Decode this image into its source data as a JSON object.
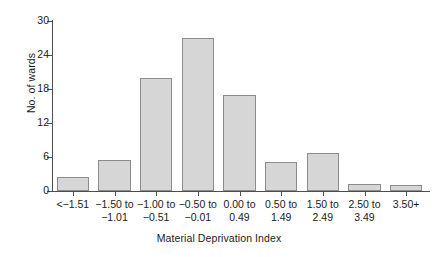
{
  "chart_data": {
    "type": "bar",
    "title": "",
    "xlabel": "Material Deprivation Index",
    "ylabel": "No. of wards",
    "categories": [
      "<−1.51",
      "−1.50 to\n−1.01",
      "−1.00 to\n−0.51",
      "−0.50 to\n−0.01",
      "0.00 to\n0.49",
      "0.50 to\n1.49",
      "1.50 to\n2.49",
      "2.50 to\n3.49",
      "3.50+"
    ],
    "values": [
      2.5,
      5.5,
      20,
      27,
      17,
      5.1,
      6.7,
      1.2,
      1.1
    ],
    "ylim": [
      0,
      30
    ],
    "yticks": [
      0,
      6,
      12,
      18,
      24,
      30
    ],
    "ytick_labels": [
      "0",
      "6",
      "12",
      "18",
      "24",
      "30"
    ],
    "grid": false,
    "legend": false,
    "bar_fill": "#d6d6d6",
    "bar_edge": "#8c8c8c",
    "axis_color": "#4d4d4d"
  }
}
